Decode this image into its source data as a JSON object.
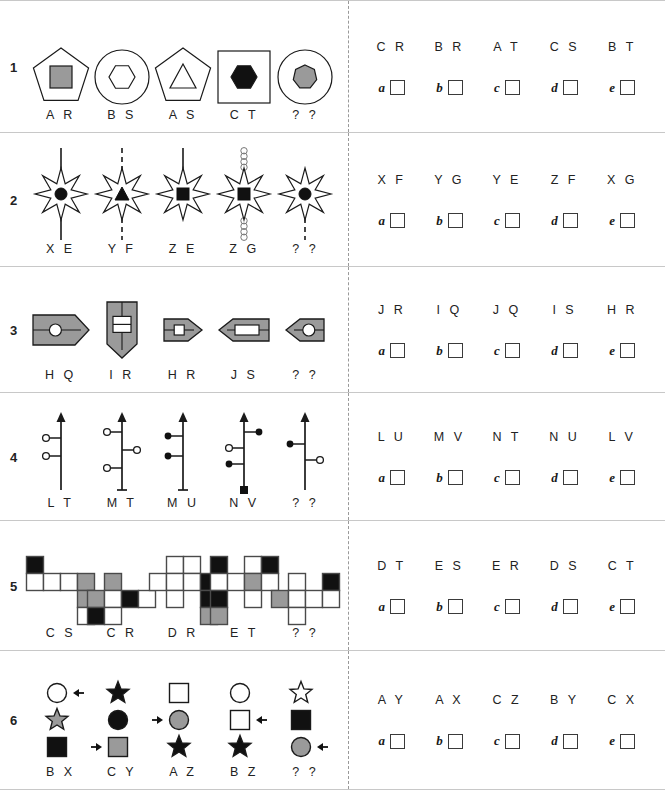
{
  "sheet": {
    "option_letters": [
      "a",
      "b",
      "c",
      "d",
      "e"
    ],
    "unknown_label": "? ?"
  },
  "rows": [
    {
      "number": "1",
      "labels": [
        "A R",
        "B S",
        "A S",
        "C T",
        "? ?"
      ],
      "codes": [
        "C R",
        "B R",
        "A T",
        "C S",
        "B T"
      ],
      "figures": [
        {
          "outer": "pentagon",
          "inner": "square",
          "inner_fill": "gray"
        },
        {
          "outer": "circle",
          "inner": "hexagon",
          "inner_fill": "white"
        },
        {
          "outer": "pentagon",
          "inner": "triangle",
          "inner_fill": "white"
        },
        {
          "outer": "square",
          "inner": "hexagon",
          "inner_fill": "black"
        },
        {
          "outer": "circle",
          "inner": "heptagon",
          "inner_fill": "gray"
        }
      ]
    },
    {
      "number": "2",
      "labels": [
        "X E",
        "Y F",
        "Z E",
        "Z G",
        "? ?"
      ],
      "codes": [
        "X F",
        "Y G",
        "Y E",
        "Z F",
        "X G"
      ],
      "figures": [
        {
          "inner": "circle",
          "line": "solid",
          "sides": "both"
        },
        {
          "inner": "triangle",
          "line": "dashed",
          "sides": "both"
        },
        {
          "inner": "square",
          "line": "solid",
          "sides": "top"
        },
        {
          "inner": "square",
          "line": "beaded",
          "sides": "both"
        },
        {
          "inner": "circle",
          "line": "dashed",
          "sides": "bottom"
        }
      ]
    },
    {
      "number": "3",
      "labels": [
        "H Q",
        "I R",
        "H R",
        "J S",
        "? ?"
      ],
      "codes": [
        "J R",
        "I Q",
        "J Q",
        "I S",
        "H R"
      ],
      "figures": [
        {
          "direction": "right",
          "size": "large",
          "inner": "circle"
        },
        {
          "direction": "down",
          "size": "large",
          "inner": "rect-split"
        },
        {
          "direction": "right",
          "size": "small",
          "inner": "rect-small"
        },
        {
          "direction": "left",
          "size": "medium",
          "inner": "rect-wide"
        },
        {
          "direction": "left",
          "size": "small",
          "inner": "circle"
        }
      ]
    },
    {
      "number": "4",
      "labels": [
        "L T",
        "M T",
        "M U",
        "N V",
        "? ?"
      ],
      "codes": [
        "L U",
        "M V",
        "N T",
        "N U",
        "L V"
      ],
      "figures": [
        {
          "branches": [
            {
              "side": "left",
              "y": 28,
              "dot": "open"
            },
            {
              "side": "left",
              "y": 46,
              "dot": "open"
            }
          ],
          "foot": "none"
        },
        {
          "branches": [
            {
              "side": "left",
              "y": 22,
              "dot": "open"
            },
            {
              "side": "right",
              "y": 40,
              "dot": "open"
            },
            {
              "side": "left",
              "y": 58,
              "dot": "open"
            }
          ],
          "foot": "bar"
        },
        {
          "branches": [
            {
              "side": "left",
              "y": 26,
              "dot": "filled"
            },
            {
              "side": "left",
              "y": 46,
              "dot": "filled"
            }
          ],
          "foot": "bar"
        },
        {
          "branches": [
            {
              "side": "right",
              "y": 22,
              "dot": "filled"
            },
            {
              "side": "left",
              "y": 38,
              "dot": "open"
            },
            {
              "side": "left",
              "y": 54,
              "dot": "filled"
            }
          ],
          "foot": "square"
        },
        {
          "branches": [
            {
              "side": "left",
              "y": 34,
              "dot": "filled"
            },
            {
              "side": "right",
              "y": 50,
              "dot": "open"
            }
          ],
          "foot": "none"
        }
      ]
    },
    {
      "number": "5",
      "labels": [
        "C S",
        "C R",
        "D R",
        "E T",
        "? ?"
      ],
      "codes": [
        "D T",
        "E S",
        "E R",
        "D S",
        "C T"
      ],
      "figures": [
        {
          "cells": [
            {
              "c": 0,
              "r": 0,
              "fill": "black"
            },
            {
              "c": 0,
              "r": 1,
              "fill": "white"
            },
            {
              "c": 1,
              "r": 1,
              "fill": "white"
            },
            {
              "c": 2,
              "r": 1,
              "fill": "white"
            },
            {
              "c": 3,
              "r": 1,
              "fill": "gray"
            },
            {
              "c": 3,
              "r": 2,
              "fill": "gray"
            },
            {
              "c": 3,
              "r": 3,
              "fill": "white"
            }
          ]
        },
        {
          "cells": [
            {
              "c": 1,
              "r": 0,
              "fill": "gray"
            },
            {
              "c": 0,
              "r": 1,
              "fill": "gray"
            },
            {
              "c": 1,
              "r": 1,
              "fill": "white"
            },
            {
              "c": 2,
              "r": 1,
              "fill": "black"
            },
            {
              "c": 3,
              "r": 1,
              "fill": "white"
            },
            {
              "c": 0,
              "r": 2,
              "fill": "black"
            },
            {
              "c": 1,
              "r": 2,
              "fill": "white"
            }
          ]
        },
        {
          "cells": [
            {
              "c": 1,
              "r": 0,
              "fill": "white"
            },
            {
              "c": 2,
              "r": 0,
              "fill": "white"
            },
            {
              "c": 0,
              "r": 1,
              "fill": "white"
            },
            {
              "c": 1,
              "r": 1,
              "fill": "white"
            },
            {
              "c": 2,
              "r": 1,
              "fill": "white"
            },
            {
              "c": 3,
              "r": 1,
              "fill": "black"
            },
            {
              "c": 1,
              "r": 2,
              "fill": "white"
            },
            {
              "c": 3,
              "r": 2,
              "fill": "black"
            },
            {
              "c": 3,
              "r": 3,
              "fill": "gray"
            }
          ]
        },
        {
          "cells": [
            {
              "c": 0,
              "r": 0,
              "fill": "black"
            },
            {
              "c": 2,
              "r": 0,
              "fill": "white"
            },
            {
              "c": 3,
              "r": 0,
              "fill": "black"
            },
            {
              "c": 0,
              "r": 1,
              "fill": "white"
            },
            {
              "c": 1,
              "r": 1,
              "fill": "white"
            },
            {
              "c": 2,
              "r": 1,
              "fill": "gray"
            },
            {
              "c": 3,
              "r": 1,
              "fill": "white"
            },
            {
              "c": 0,
              "r": 2,
              "fill": "black"
            },
            {
              "c": 2,
              "r": 2,
              "fill": "white"
            },
            {
              "c": 0,
              "r": 3,
              "fill": "gray"
            }
          ]
        },
        {
          "cells": [
            {
              "c": 1,
              "r": 0,
              "fill": "white"
            },
            {
              "c": 3,
              "r": 0,
              "fill": "black"
            },
            {
              "c": 0,
              "r": 1,
              "fill": "gray"
            },
            {
              "c": 1,
              "r": 1,
              "fill": "white"
            },
            {
              "c": 2,
              "r": 1,
              "fill": "white"
            },
            {
              "c": 3,
              "r": 1,
              "fill": "white"
            },
            {
              "c": 1,
              "r": 2,
              "fill": "white"
            }
          ]
        }
      ]
    },
    {
      "number": "6",
      "labels": [
        "B X",
        "C Y",
        "A Z",
        "B Z",
        "? ?"
      ],
      "codes": [
        "A Y",
        "A X",
        "C Z",
        "B Y",
        "C X"
      ],
      "figures": [
        {
          "items": [
            {
              "shape": "circle",
              "fill": "white",
              "arrow": "left"
            },
            {
              "shape": "star",
              "fill": "gray",
              "arrow": "none"
            },
            {
              "shape": "square",
              "fill": "black",
              "arrow": "none"
            }
          ]
        },
        {
          "items": [
            {
              "shape": "star",
              "fill": "black",
              "arrow": "none"
            },
            {
              "shape": "circle",
              "fill": "black",
              "arrow": "none"
            },
            {
              "shape": "square",
              "fill": "gray",
              "arrow": "right"
            }
          ]
        },
        {
          "items": [
            {
              "shape": "square",
              "fill": "white",
              "arrow": "none"
            },
            {
              "shape": "circle",
              "fill": "gray",
              "arrow": "right"
            },
            {
              "shape": "star",
              "fill": "black",
              "arrow": "none"
            }
          ]
        },
        {
          "items": [
            {
              "shape": "circle",
              "fill": "white",
              "arrow": "none"
            },
            {
              "shape": "square",
              "fill": "white",
              "arrow": "left"
            },
            {
              "shape": "star",
              "fill": "black",
              "arrow": "none"
            }
          ]
        },
        {
          "items": [
            {
              "shape": "star",
              "fill": "white",
              "arrow": "none"
            },
            {
              "shape": "square",
              "fill": "black",
              "arrow": "none"
            },
            {
              "shape": "circle",
              "fill": "gray",
              "arrow": "left"
            }
          ]
        }
      ]
    }
  ],
  "colors": {
    "gray_fill": "#9a9a9a",
    "black_fill": "#111111",
    "white_fill": "#ffffff",
    "stroke": "#1a1a1a",
    "divider": "#999999"
  }
}
